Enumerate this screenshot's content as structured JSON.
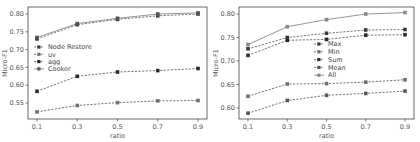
{
  "chart_data": [
    {
      "type": "line",
      "title": "",
      "xlabel": "ratio",
      "ylabel": "Micro-F1",
      "x": [
        0.1,
        0.3,
        0.5,
        0.7,
        0.9
      ],
      "xticks": [
        "0.1",
        "0.3",
        "0.5",
        "0.7",
        "0.9"
      ],
      "yticks": [
        "0.55",
        "0.60",
        "0.65",
        "0.70",
        "0.75",
        "0.80"
      ],
      "ylim": [
        0.515,
        0.82
      ],
      "grid": false,
      "legend_position": "center-left",
      "series": [
        {
          "name": "Node Restore",
          "style": "dashed",
          "values": [
            0.73,
            0.77,
            0.785,
            0.795,
            0.8
          ]
        },
        {
          "name": "uv",
          "style": "dashed",
          "values": [
            0.525,
            0.543,
            0.551,
            0.556,
            0.557
          ]
        },
        {
          "name": "agg",
          "style": "dashed",
          "values": [
            0.583,
            0.625,
            0.637,
            0.641,
            0.647
          ]
        },
        {
          "name": "Cooker",
          "style": "solid",
          "values": [
            0.734,
            0.773,
            0.788,
            0.8,
            0.803
          ]
        }
      ]
    },
    {
      "type": "line",
      "title": "",
      "xlabel": "ratio",
      "ylabel": "Micro-F1",
      "x": [
        0.1,
        0.3,
        0.5,
        0.7,
        0.9
      ],
      "xticks": [
        "0.1",
        "0.3",
        "0.5",
        "0.7",
        "0.9"
      ],
      "yticks": [
        "0.60",
        "0.65",
        "0.70",
        "0.75",
        "0.80"
      ],
      "ylim": [
        0.58,
        0.815
      ],
      "grid": false,
      "legend_position": "center",
      "series": [
        {
          "name": "Max",
          "style": "dashed",
          "values": [
            0.726,
            0.75,
            0.759,
            0.766,
            0.767
          ]
        },
        {
          "name": "Min",
          "style": "dashed",
          "values": [
            0.625,
            0.651,
            0.652,
            0.655,
            0.66
          ]
        },
        {
          "name": "Sum",
          "style": "dashed",
          "values": [
            0.712,
            0.744,
            0.746,
            0.755,
            0.756
          ]
        },
        {
          "name": "Mean",
          "style": "dashed",
          "values": [
            0.589,
            0.616,
            0.627,
            0.631,
            0.636
          ]
        },
        {
          "name": "All",
          "style": "solid",
          "values": [
            0.735,
            0.773,
            0.788,
            0.8,
            0.803
          ]
        }
      ]
    }
  ],
  "colors": {
    "line": "#555555",
    "marker": "#333333",
    "axis": "#333333"
  }
}
